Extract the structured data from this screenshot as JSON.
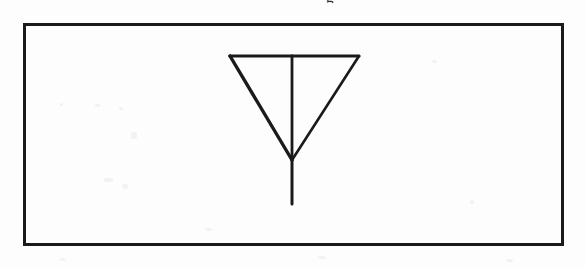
{
  "document": {
    "kind": "scanned-figure",
    "background_color": "#fdfdfd",
    "ink_color": "#1a1a1a",
    "width": 586,
    "height": 268
  },
  "figure": {
    "frame": {
      "label": "figure-border",
      "x": 23,
      "y": 23,
      "width": 541,
      "height": 223,
      "stroke_width": 3,
      "stroke_color": "#1a1a1a",
      "fill": "none"
    },
    "drawing": {
      "label": "inverted-triangle-with-stem",
      "description": "An inverted (point-down) triangle with a vertical line drawn from the midpoint of its top edge through the apex and continuing below it.",
      "stroke_color": "#1a1a1a",
      "vertices": {
        "top_left": [
          230,
          56
        ],
        "top_right": [
          359,
          56
        ],
        "apex": [
          292,
          160
        ]
      },
      "strokes": [
        {
          "name": "top-edge",
          "from": [
            230,
            56
          ],
          "to": [
            359,
            56
          ],
          "width": 3.2
        },
        {
          "name": "left-diagonal",
          "from": [
            230,
            56
          ],
          "to": [
            292,
            160
          ],
          "width": 3.4
        },
        {
          "name": "right-diagonal",
          "from": [
            359,
            56
          ],
          "to": [
            292,
            160
          ],
          "width": 2.6
        },
        {
          "name": "center-vertical",
          "from": [
            292,
            56
          ],
          "to": [
            292,
            160
          ],
          "width": 2.8
        },
        {
          "name": "stem-tail",
          "from": [
            292,
            160
          ],
          "to": [
            292,
            204
          ],
          "width": 3.0
        }
      ]
    }
  },
  "artifacts": {
    "caption_remnant": {
      "label": "clipped-text-descender",
      "text": "g",
      "x": 326,
      "y": 0,
      "note": "bottom of a glyph from a text line cropped above the figure"
    },
    "specks": [
      {
        "x": 95,
        "y": 104,
        "w": 5,
        "h": 3
      },
      {
        "x": 119,
        "y": 107,
        "w": 4,
        "h": 3
      },
      {
        "x": 131,
        "y": 132,
        "w": 6,
        "h": 7
      },
      {
        "x": 104,
        "y": 178,
        "w": 9,
        "h": 4
      },
      {
        "x": 122,
        "y": 184,
        "w": 6,
        "h": 5
      },
      {
        "x": 60,
        "y": 103,
        "w": 3,
        "h": 3
      },
      {
        "x": 205,
        "y": 228,
        "w": 7,
        "h": 3
      },
      {
        "x": 432,
        "y": 60,
        "w": 5,
        "h": 3
      },
      {
        "x": 470,
        "y": 200,
        "w": 4,
        "h": 4
      },
      {
        "x": 318,
        "y": 256,
        "w": 8,
        "h": 3
      },
      {
        "x": 60,
        "y": 258,
        "w": 6,
        "h": 3
      },
      {
        "x": 506,
        "y": 259,
        "w": 7,
        "h": 3
      }
    ]
  }
}
